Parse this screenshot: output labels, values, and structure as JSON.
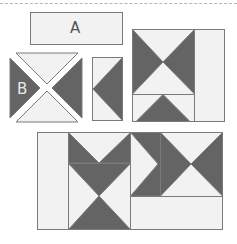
{
  "labels": {
    "a": "A",
    "b": "B"
  },
  "colors": {
    "dark": "#646464",
    "light": "#f2f2f2",
    "stroke": "#7a7a7a"
  },
  "pieces": [
    {
      "id": "A",
      "shape": "rectangle"
    },
    {
      "id": "B",
      "shape": "square cut by diagonals into 4 triangles, left and right dark"
    },
    {
      "id": "narrow",
      "shape": "rectangle with dark triangle pointing left"
    },
    {
      "id": "block-top-right",
      "shape": "hourglass square + half triangle + side strip"
    },
    {
      "id": "block-bottom",
      "shape": "assembled quilt block"
    }
  ]
}
